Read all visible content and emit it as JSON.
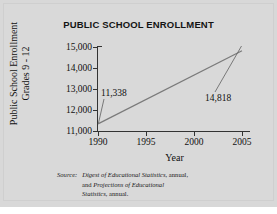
{
  "chart_data": {
    "type": "line",
    "title": "PUBLIC SCHOOL ENROLLMENT",
    "xlabel": "Year",
    "ylabel": "Public School Enrollment Grades 9 - 12",
    "ylabel_lines": [
      "Public School Enrollment",
      "Grades 9 - 12"
    ],
    "x": [
      1990,
      2005
    ],
    "values": [
      11338,
      14818
    ],
    "series": [
      {
        "name": "Public School Enrollment Grades 9 - 12",
        "values": [
          11338,
          14818
        ]
      }
    ],
    "xlim": [
      1990,
      2005
    ],
    "ylim": [
      11000,
      15000
    ],
    "xticks": [
      1990,
      1995,
      2000,
      2005
    ],
    "xtick_labels": [
      "1990",
      "1995",
      "2000",
      "2005"
    ],
    "yticks": [
      11000,
      12000,
      13000,
      14000,
      15000
    ],
    "ytick_labels": [
      "11,000",
      "12,000",
      "13,000",
      "14,000",
      "15,000"
    ],
    "point_labels": [
      {
        "label": "11,338",
        "x": 1990,
        "y": 11338
      },
      {
        "label": "14,818",
        "x": 2005,
        "y": 14818
      }
    ],
    "grid": false,
    "legend": "none",
    "line_color": "#7a7a7a",
    "background_color": "#d9d9d9",
    "axis_color": "#333333"
  },
  "source": {
    "prefix": "Source:",
    "line1_italic": "Digest of Educational Statistics",
    "line1_rest": ", annual,",
    "line2_lead": "and ",
    "line2_italic": "Projections of Educational",
    "line3_italic": "Statistics",
    "line3_rest": ", annual."
  }
}
